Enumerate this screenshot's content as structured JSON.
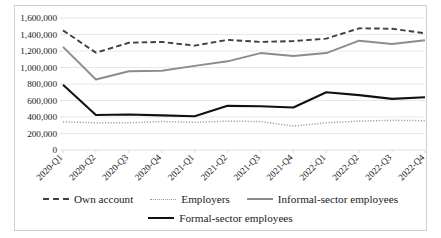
{
  "chart_data": {
    "type": "line",
    "title": "",
    "subtitle": "",
    "xlabel": "",
    "ylabel": "",
    "grid": true,
    "legend_position": "bottom",
    "ylim": [
      0,
      1600000
    ],
    "ytick_values": [
      0,
      200000,
      400000,
      600000,
      800000,
      1000000,
      1200000,
      1400000,
      1600000
    ],
    "ytick_labels": [
      "0",
      "200,000",
      "400,000",
      "600,000",
      "800,000",
      "1,000,000",
      "1,200,000",
      "1,400,000",
      "1,600,000"
    ],
    "categories": [
      "2020-Q1",
      "2020-Q2",
      "2020-Q3",
      "2020-Q4",
      "2021-Q1",
      "2021-Q2",
      "2021-Q3",
      "2021-Q4",
      "2022-Q1",
      "2022-Q2",
      "2022-Q3",
      "2022-Q4"
    ],
    "series": [
      {
        "name": "Own account",
        "style": "dashed",
        "color": "#404040",
        "values": [
          1450000,
          1180000,
          1300000,
          1310000,
          1265000,
          1335000,
          1310000,
          1320000,
          1350000,
          1475000,
          1470000,
          1415000
        ]
      },
      {
        "name": "Employers",
        "style": "dotted",
        "color": "#9a9a9a",
        "values": [
          340000,
          330000,
          330000,
          345000,
          335000,
          350000,
          345000,
          290000,
          330000,
          350000,
          360000,
          355000
        ]
      },
      {
        "name": "Informal-sector employees",
        "style": "solid",
        "color": "#8c8c8c",
        "values": [
          1250000,
          855000,
          955000,
          960000,
          1020000,
          1075000,
          1175000,
          1140000,
          1175000,
          1325000,
          1285000,
          1330000
        ]
      },
      {
        "name": "Formal-sector employees",
        "style": "solid-bold",
        "color": "#111111",
        "values": [
          790000,
          425000,
          430000,
          420000,
          410000,
          535000,
          530000,
          515000,
          700000,
          665000,
          620000,
          640000
        ]
      }
    ]
  },
  "legend": {
    "items": [
      {
        "label": "Own account",
        "swatch": "dashed-line-swatch"
      },
      {
        "label": "Employers",
        "swatch": "dotted-line-swatch"
      },
      {
        "label": "Informal-sector employees",
        "swatch": "gray-solid-line-swatch"
      },
      {
        "label": "Formal-sector employees",
        "swatch": "black-solid-line-swatch"
      }
    ]
  }
}
